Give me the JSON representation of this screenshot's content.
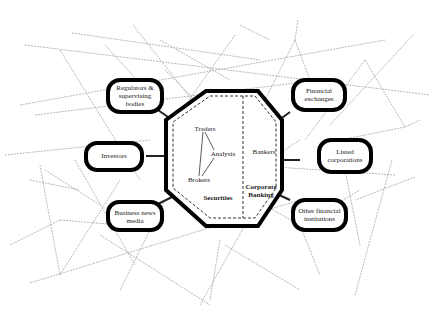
{
  "center": {
    "left_section": {
      "title": "Securities",
      "roles": [
        "Traders",
        "Analysis",
        "Brokers"
      ]
    },
    "right_section": {
      "title": "Corporate Banking",
      "roles": [
        "Bankers"
      ]
    }
  },
  "nodes": {
    "left": [
      {
        "label": "Regulators & supervising bodies"
      },
      {
        "label": "Investors"
      },
      {
        "label": "Business news media"
      }
    ],
    "right": [
      {
        "label": "Financial exchanges"
      },
      {
        "label": "Listed corporations"
      },
      {
        "label": "Other financial institutions"
      }
    ]
  },
  "colors": {
    "outline": "#000000",
    "network_lines": "#9a9a9a",
    "background": "#ffffff"
  }
}
